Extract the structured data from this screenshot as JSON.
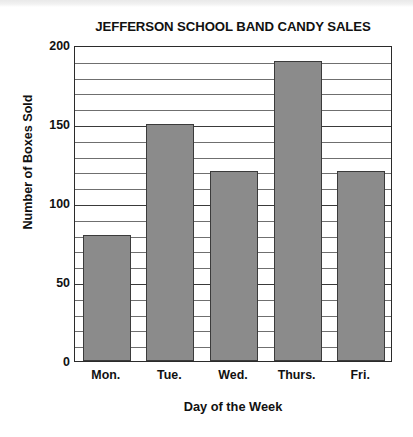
{
  "chart_data": {
    "type": "bar",
    "title": "JEFFERSON SCHOOL BAND CANDY SALES",
    "xlabel": "Day of the Week",
    "ylabel": "Number of Boxes Sold",
    "categories": [
      "Mon.",
      "Tue.",
      "Wed.",
      "Thurs.",
      "Fri."
    ],
    "values": [
      80,
      150,
      120,
      190,
      120
    ],
    "ylim": [
      0,
      200
    ],
    "y_major_ticks": [
      0,
      50,
      100,
      150,
      200
    ],
    "y_major_tick_labels": [
      "0",
      "50",
      "100",
      "150",
      "200"
    ],
    "y_minor_tick_interval": 10,
    "grid": "horizontal",
    "legend": "none",
    "bar_color": "#8b8b8b",
    "bar_border_color": "#3b3b3b",
    "axis_color": "#2b2b2b",
    "gridline_color": "#6f6f6f",
    "background_color": "#ffffff"
  }
}
